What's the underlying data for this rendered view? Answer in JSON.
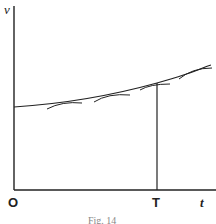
{
  "figure": {
    "y_axis_label": "v",
    "x_axis_label": "t",
    "origin_label": "O",
    "marker_label": "T",
    "caption": "Fig. 14"
  },
  "colors": {
    "ink": "#222222",
    "background": "#ffffff"
  }
}
